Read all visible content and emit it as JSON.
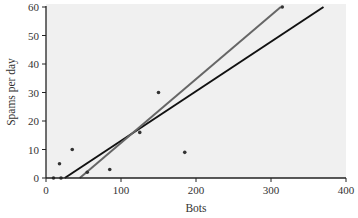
{
  "chart_data": {
    "type": "scatter",
    "title": "",
    "xlabel": "Bots",
    "ylabel": "Spams per day",
    "xlim": [
      0,
      400
    ],
    "ylim": [
      0,
      60
    ],
    "x_ticks": [
      0,
      100,
      200,
      300,
      400
    ],
    "y_ticks": [
      0,
      10,
      20,
      30,
      40,
      50,
      60
    ],
    "grid": false,
    "legend": null,
    "background": "#f0f0f0",
    "series": [
      {
        "name": "observations",
        "kind": "scatter",
        "color": "#333333",
        "points": [
          {
            "x": 10,
            "y": 0
          },
          {
            "x": 20,
            "y": 0
          },
          {
            "x": 18,
            "y": 5
          },
          {
            "x": 35,
            "y": 10
          },
          {
            "x": 55,
            "y": 2
          },
          {
            "x": 85,
            "y": 3
          },
          {
            "x": 125,
            "y": 16
          },
          {
            "x": 150,
            "y": 30
          },
          {
            "x": 185,
            "y": 9
          },
          {
            "x": 315,
            "y": 60
          }
        ]
      },
      {
        "name": "fit-line-black",
        "kind": "line",
        "color": "#111111",
        "points": [
          {
            "x": 25,
            "y": 0
          },
          {
            "x": 370,
            "y": 60
          }
        ]
      },
      {
        "name": "fit-line-gray",
        "kind": "line",
        "color": "#666666",
        "points": [
          {
            "x": 45,
            "y": 0
          },
          {
            "x": 313,
            "y": 60
          }
        ]
      }
    ]
  }
}
